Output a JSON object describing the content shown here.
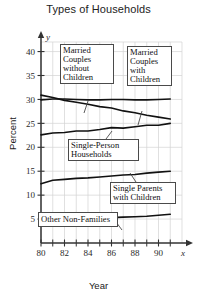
{
  "chart_data": {
    "type": "line",
    "title": "Types of Households",
    "xlabel": "Year",
    "ylabel": "Percent",
    "x_axis_symbol": "x",
    "y_axis_symbol": "y",
    "xlim": [
      80,
      92
    ],
    "ylim": [
      0,
      42
    ],
    "x_ticks": [
      80,
      82,
      84,
      86,
      88,
      90
    ],
    "x_tick_labels": [
      "80",
      "82",
      "84",
      "86",
      "88",
      "90"
    ],
    "x_minor_ticks": [
      81,
      83,
      85,
      87,
      89,
      91
    ],
    "y_ticks": [
      5,
      10,
      15,
      20,
      25,
      30,
      35,
      40
    ],
    "y_tick_labels": [
      "5",
      "10",
      "15",
      "20",
      "25",
      "30",
      "35",
      "40"
    ],
    "grid": true,
    "legend": "annotations",
    "x": [
      80,
      81,
      82,
      83,
      84,
      85,
      86,
      87,
      88,
      89,
      90,
      91
    ],
    "series": [
      {
        "name": "Married Couples with Children",
        "values": [
          30.9,
          30.4,
          29.8,
          29.4,
          29.0,
          28.5,
          28.2,
          27.6,
          27.2,
          26.7,
          26.3,
          25.9
        ]
      },
      {
        "name": "Married Couples without Children",
        "values": [
          29.9,
          30.1,
          30.1,
          30.0,
          29.9,
          29.9,
          30.0,
          30.0,
          29.9,
          29.9,
          30.0,
          30.1
        ]
      },
      {
        "name": "Single-Person Households",
        "values": [
          22.6,
          23.0,
          23.1,
          23.4,
          23.4,
          23.7,
          24.1,
          24.0,
          24.3,
          24.6,
          24.6,
          25.0
        ]
      },
      {
        "name": "Single Parents with Children",
        "values": [
          12.4,
          13.1,
          13.3,
          13.5,
          13.6,
          13.8,
          14.0,
          14.2,
          14.3,
          14.6,
          14.8,
          15.0
        ]
      },
      {
        "name": "Other Non-Families",
        "values": [
          4.4,
          4.5,
          4.7,
          5.0,
          5.1,
          5.2,
          5.3,
          5.4,
          5.5,
          5.6,
          5.8,
          6.0
        ]
      }
    ],
    "annotations": [
      {
        "id": "married-couples-without-children",
        "label": "Married\nCouples\nwithout\nChildren",
        "points_to_series": "Married Couples without Children"
      },
      {
        "id": "married-couples-with-children",
        "label": "Married\nCouples\nwith\nChildren",
        "points_to_series": "Married Couples with Children"
      },
      {
        "id": "single-person-households",
        "label": "Single-Person\nHouseholds",
        "points_to_series": "Single-Person Households"
      },
      {
        "id": "single-parents-with-children",
        "label": "Single Parents\nwith Children",
        "points_to_series": "Single Parents with Children"
      },
      {
        "id": "other-non-families",
        "label": "Other Non-Families",
        "points_to_series": "Other Non-Families"
      }
    ],
    "colors": {
      "line": "#111111",
      "grid": "#d2d2d2",
      "axis": "#333333",
      "background": "#ffffff"
    }
  },
  "ticks": {
    "y": {
      "t40": "40",
      "t35": "35",
      "t30": "30",
      "t25": "25",
      "t20": "20",
      "t15": "15",
      "t10": "10",
      "t5": "5"
    },
    "x": {
      "t80": "80",
      "t82": "82",
      "t84": "84",
      "t86": "86",
      "t88": "88",
      "t90": "90"
    },
    "symbols": {
      "x": "x",
      "y": "y"
    }
  },
  "labels": {
    "title": "Types of Households",
    "xlabel": "Year",
    "ylabel": "Percent"
  },
  "callouts": {
    "married_without": "Married\nCouples\nwithout\nChildren",
    "married_with": "Married\nCouples\nwith\nChildren",
    "single_person": "Single-Person\nHouseholds",
    "single_parents": "Single Parents\nwith Children",
    "other_non_families": "Other Non-Families"
  }
}
